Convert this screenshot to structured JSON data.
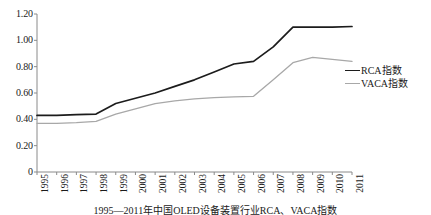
{
  "chart_data": {
    "type": "line",
    "title": "",
    "xlabel": "",
    "ylabel": "",
    "categories": [
      "1995",
      "1996",
      "1997",
      "1998",
      "1999",
      "2000",
      "2001",
      "2002",
      "2003",
      "2004",
      "2005",
      "2006",
      "2007",
      "2008",
      "2009",
      "2010",
      "2011"
    ],
    "series": [
      {
        "name": "RCA指数",
        "color": "#1c1c1c",
        "values": [
          0.43,
          0.43,
          0.435,
          0.44,
          0.52,
          0.56,
          0.6,
          0.65,
          0.7,
          0.76,
          0.82,
          0.84,
          0.95,
          1.1,
          1.1,
          1.1,
          1.105
        ]
      },
      {
        "name": "VACA指数",
        "color": "#a8a8a8",
        "values": [
          0.37,
          0.37,
          0.375,
          0.385,
          0.44,
          0.48,
          0.52,
          0.54,
          0.555,
          0.565,
          0.57,
          0.575,
          0.7,
          0.83,
          0.87,
          0.855,
          0.84
        ]
      }
    ],
    "ylim": [
      0,
      1.2
    ],
    "yticks": [
      "0",
      "0.20",
      "0.40",
      "0.60",
      "0.80",
      "1.00",
      "1.20"
    ],
    "ytick_values": [
      0,
      0.2,
      0.4,
      0.6,
      0.8,
      1.0,
      1.2
    ],
    "grid": false,
    "legend_position": "right"
  },
  "legend": {
    "items": [
      {
        "label": "RCA指数"
      },
      {
        "label": "VACA指数"
      }
    ]
  },
  "caption": {
    "text": "1995—2011年中国OLED设备装置行业RCA、VACA指数"
  }
}
